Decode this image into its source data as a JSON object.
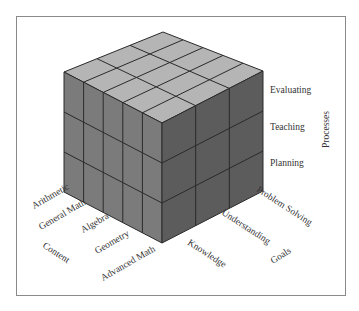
{
  "diagram": {
    "type": "3d-cube-taxonomy",
    "axes": {
      "content": {
        "title": "Content",
        "items": [
          "Arithmetic",
          "General Math",
          "Algebra",
          "Geometry",
          "Advanced Math"
        ]
      },
      "goals": {
        "title": "Goals",
        "items": [
          "Knowledge",
          "Understanding",
          "Problem Solving"
        ]
      },
      "processes": {
        "title": "Processes",
        "items": [
          "Evaluating",
          "Teaching",
          "Planning"
        ]
      }
    },
    "colors": {
      "top_face": "#b5b5b5",
      "left_face": "#7b7b7b",
      "right_face": "#5c5c5c",
      "grid_line": "#2a2a2a",
      "frame": "#8a8a8a",
      "text": "#333333"
    }
  }
}
